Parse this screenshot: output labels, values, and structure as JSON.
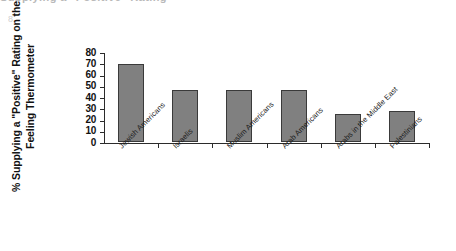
{
  "figure": {
    "scan_artifact_top": "Supplying a \"Positive\" Rating",
    "scan_artifact_corner": "8."
  },
  "chart_data": {
    "type": "bar",
    "title": "",
    "subtitle": "",
    "xlabel": "",
    "ylabel": "% Supplying a \"Positive\" Rating on the Feeling Thermometer",
    "categories": [
      "Jewish Americans",
      "Israelis",
      "Muslim Americans",
      "Arab Americans",
      "Arabs in the Middle East",
      "Palestinians"
    ],
    "values": [
      69,
      46,
      46,
      46,
      25,
      28
    ],
    "ylim": [
      0,
      80
    ],
    "ytick_values": [
      0,
      10,
      20,
      30,
      40,
      50,
      60,
      70,
      80
    ],
    "ytick_labels": [
      "0",
      "10",
      "20",
      "30",
      "40",
      "50",
      "60",
      "70",
      "80"
    ],
    "grid": false,
    "legend": null,
    "bar_color": "#808080",
    "bar_edge_color": "#3a3a3a",
    "axis_color": "#2b2b2b",
    "background": "#ffffff",
    "annotations": []
  }
}
